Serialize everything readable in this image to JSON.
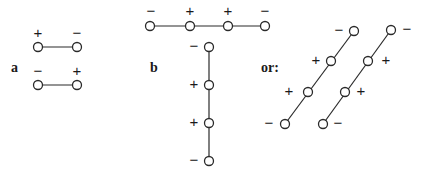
{
  "figure": {
    "panels": [
      {
        "label": "a",
        "label_pos": [
          11,
          72
        ],
        "chains": [
          {
            "atoms": [
              {
                "x": 38,
                "y": 47,
                "sign": "+",
                "sx": 38,
                "sy": 38
              },
              {
                "x": 77,
                "y": 47,
                "sign": "−",
                "sx": 77,
                "sy": 38
              }
            ]
          },
          {
            "atoms": [
              {
                "x": 38,
                "y": 85,
                "sign": "−",
                "sx": 38,
                "sy": 76
              },
              {
                "x": 77,
                "y": 85,
                "sign": "+",
                "sx": 77,
                "sy": 76
              }
            ]
          }
        ]
      },
      {
        "label": "b",
        "label_pos": [
          150,
          72
        ],
        "chains": [
          {
            "atoms": [
              {
                "x": 150,
                "y": 26,
                "sign": "−",
                "sx": 151,
                "sy": 16
              },
              {
                "x": 190,
                "y": 26,
                "sign": "+",
                "sx": 190,
                "sy": 16
              },
              {
                "x": 228,
                "y": 26,
                "sign": "+",
                "sx": 228,
                "sy": 16
              },
              {
                "x": 265,
                "y": 26,
                "sign": "−",
                "sx": 265,
                "sy": 16
              }
            ]
          },
          {
            "atoms": [
              {
                "x": 209,
                "y": 47,
                "sign": "−",
                "sx": 194,
                "sy": 51
              },
              {
                "x": 209,
                "y": 85,
                "sign": "+",
                "sx": 194,
                "sy": 89
              },
              {
                "x": 209,
                "y": 123,
                "sign": "+",
                "sx": 194,
                "sy": 127
              },
              {
                "x": 209,
                "y": 161,
                "sign": "−",
                "sx": 194,
                "sy": 165
              }
            ]
          }
        ]
      },
      {
        "label": "or:",
        "label_pos": [
          261,
          72
        ],
        "chains": [
          {
            "atoms": [
              {
                "x": 285,
                "y": 124,
                "sign": "−",
                "sx": 269,
                "sy": 128
              },
              {
                "x": 308,
                "y": 92,
                "sign": "+",
                "sx": 289,
                "sy": 96
              },
              {
                "x": 331,
                "y": 61,
                "sign": "+",
                "sx": 316,
                "sy": 65
              },
              {
                "x": 354,
                "y": 31,
                "sign": "−",
                "sx": 339,
                "sy": 35
              }
            ]
          },
          {
            "atoms": [
              {
                "x": 323,
                "y": 124,
                "sign": "−",
                "sx": 338,
                "sy": 128
              },
              {
                "x": 345,
                "y": 92,
                "sign": "+",
                "sx": 361,
                "sy": 96
              },
              {
                "x": 368,
                "y": 61,
                "sign": "+",
                "sx": 386,
                "sy": 65
              },
              {
                "x": 391,
                "y": 30,
                "sign": "−",
                "sx": 407,
                "sy": 34
              }
            ]
          }
        ]
      }
    ]
  }
}
